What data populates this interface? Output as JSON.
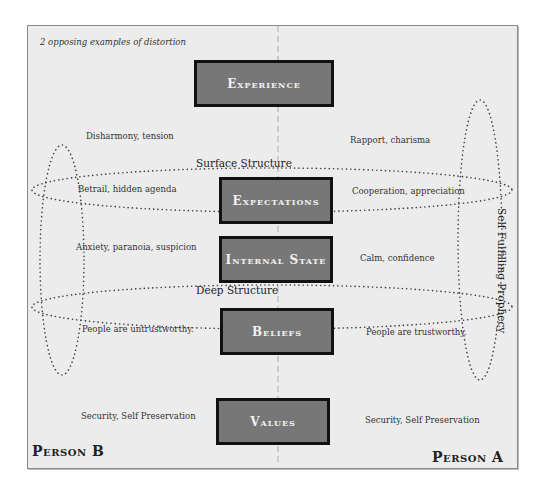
{
  "caption": "2 opposing examples of distortion",
  "levels": [
    {
      "id": "experience",
      "label": "Experience",
      "person_b": "Disharmony, tension",
      "person_a": "Rapport, charisma"
    },
    {
      "id": "expectations",
      "label": "Expectations",
      "person_b": "Betrail, hidden agenda",
      "person_a": "Cooperation, appreciation"
    },
    {
      "id": "internal_state",
      "label": "Internal State",
      "person_b": "Anxiety, paranoia, suspicion",
      "person_a": "Calm, confidence"
    },
    {
      "id": "beliefs",
      "label": "Beliefs",
      "person_b": "People are untrustworthy.",
      "person_a": "People are trustworthy."
    },
    {
      "id": "values",
      "label": "Values",
      "person_b": "Security, Self Preservation",
      "person_a": "Security, Self Preservation"
    }
  ],
  "structures": {
    "surface": "Surface Structure",
    "deep": "Deep Structure",
    "loop": "Self Fulfilling Prophecy"
  },
  "persons": {
    "left": "Person B",
    "right": "Person A"
  },
  "colors": {
    "box_fill": "#777777",
    "box_border": "#111111",
    "background": "#ececec",
    "dots": "#444444"
  }
}
